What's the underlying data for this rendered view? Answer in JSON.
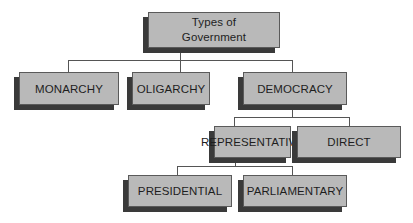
{
  "diagram": {
    "type": "hierarchy",
    "title": "Types of Government",
    "root": {
      "label_line1": "Types of",
      "label_line2": "Government"
    },
    "level1": [
      {
        "label": "MONARCHY"
      },
      {
        "label": "OLIGARCHY"
      },
      {
        "label": "DEMOCRACY"
      }
    ],
    "democracy_children": [
      {
        "label": "REPRESENTATIVE"
      },
      {
        "label": "DIRECT"
      }
    ],
    "representative_children": [
      {
        "label": "PRESIDENTIAL"
      },
      {
        "label": "PARLIAMENTARY"
      }
    ],
    "edges": [
      [
        "Types of Government",
        "MONARCHY"
      ],
      [
        "Types of Government",
        "OLIGARCHY"
      ],
      [
        "Types of Government",
        "DEMOCRACY"
      ],
      [
        "DEMOCRACY",
        "REPRESENTATIVE"
      ],
      [
        "DEMOCRACY",
        "DIRECT"
      ],
      [
        "REPRESENTATIVE",
        "PRESIDENTIAL"
      ],
      [
        "REPRESENTATIVE",
        "PARLIAMENTARY"
      ]
    ],
    "colors": {
      "box_fill": "#b9b9b9",
      "box_border": "#5a5a5a",
      "shadow": "#3a3a3a",
      "connector": "#555555",
      "text": "#1e1e1e",
      "background": "#ffffff"
    }
  }
}
